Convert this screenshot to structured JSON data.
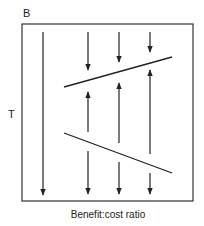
{
  "labels": {
    "top_left": "B",
    "left": "T",
    "x_axis": "Benefit:cost ratio"
  },
  "colors": {
    "ink": "#222222",
    "background": "#ffffff"
  },
  "diagram": {
    "frame": {
      "x": 22,
      "y": 24,
      "w": 171,
      "h": 177
    },
    "long_arrow": {
      "x": 43,
      "y1": 32,
      "y2": 195,
      "direction": "down"
    },
    "upper_threshold_line": {
      "x1": 64,
      "y1": 87,
      "x2": 172,
      "y2": 57
    },
    "lower_threshold_line": {
      "x1": 64,
      "y1": 133,
      "x2": 172,
      "y2": 173
    },
    "columns": [
      {
        "x": 88,
        "top_down": [
          32,
          70
        ],
        "middle_up": [
          132,
          92
        ],
        "bottom_down": [
          151,
          194
        ]
      },
      {
        "x": 119,
        "top_down": [
          32,
          62
        ],
        "middle_up": [
          143,
          83
        ],
        "bottom_down": [
          162,
          194
        ]
      },
      {
        "x": 150,
        "top_down": [
          32,
          52
        ],
        "middle_up": [
          154,
          70
        ],
        "bottom_down": [
          173,
          194
        ]
      }
    ]
  }
}
